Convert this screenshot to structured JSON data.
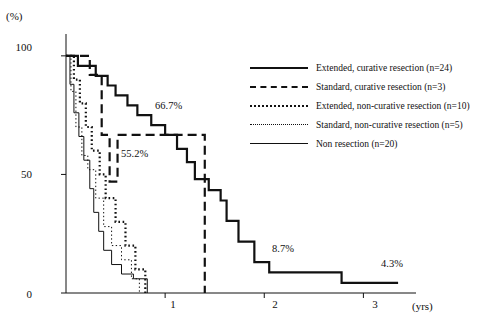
{
  "chart_data": {
    "type": "line",
    "title": "",
    "xlabel": "(yrs)",
    "ylabel": "(%)",
    "xlim": [
      0,
      3.45
    ],
    "ylim": [
      0,
      105
    ],
    "xticks": [
      "1",
      "2",
      "3"
    ],
    "xtick_values": [
      1,
      2,
      3
    ],
    "yticks": [
      "0",
      "50",
      "100"
    ],
    "ytick_values": [
      0,
      50,
      100
    ],
    "grid": false,
    "legend_position": "right-top",
    "annotations": [
      {
        "text": "66.7%",
        "x": 1.02,
        "y": 72
      },
      {
        "text": "55.2%",
        "x": 0.72,
        "y": 55
      },
      {
        "text": "8.7%",
        "x": 1.95,
        "y": 17
      },
      {
        "text": "4.3%",
        "x": 2.78,
        "y": 12
      }
    ],
    "series": [
      {
        "name": "Extended, curative resection",
        "n": 24,
        "label": "Extended, curative resection   (n=24)",
        "style": "solid-thick",
        "color": "#111111",
        "points": [
          [
            0,
            100
          ],
          [
            0.12,
            100
          ],
          [
            0.12,
            95.8
          ],
          [
            0.3,
            95.8
          ],
          [
            0.3,
            91.6
          ],
          [
            0.42,
            91.6
          ],
          [
            0.42,
            87.5
          ],
          [
            0.5,
            87.5
          ],
          [
            0.5,
            83.3
          ],
          [
            0.62,
            83.3
          ],
          [
            0.62,
            79.1
          ],
          [
            0.72,
            79.1
          ],
          [
            0.72,
            75
          ],
          [
            0.86,
            75
          ],
          [
            0.86,
            70.8
          ],
          [
            1.0,
            70.8
          ],
          [
            1.0,
            66.7
          ],
          [
            1.12,
            66.7
          ],
          [
            1.12,
            60.8
          ],
          [
            1.22,
            60.8
          ],
          [
            1.22,
            55.2
          ],
          [
            1.3,
            55.2
          ],
          [
            1.3,
            48
          ],
          [
            1.44,
            48
          ],
          [
            1.44,
            43.4
          ],
          [
            1.56,
            43.4
          ],
          [
            1.56,
            39
          ],
          [
            1.62,
            39
          ],
          [
            1.62,
            30.4
          ],
          [
            1.74,
            30.4
          ],
          [
            1.74,
            21.7
          ],
          [
            1.9,
            21.7
          ],
          [
            1.9,
            13
          ],
          [
            2.05,
            13
          ],
          [
            2.05,
            8.7
          ],
          [
            2.78,
            8.7
          ],
          [
            2.78,
            4.3
          ],
          [
            3.35,
            4.3
          ]
        ]
      },
      {
        "name": "Standard, curative resection",
        "n": 3,
        "label": "Standard, curative resection   (n=3)",
        "style": "dashed-thick",
        "color": "#111111",
        "points": [
          [
            0,
            100
          ],
          [
            0.24,
            100
          ],
          [
            0.24,
            92
          ],
          [
            0.36,
            92
          ],
          [
            0.36,
            66.7
          ],
          [
            0.44,
            66.7
          ],
          [
            0.44,
            47
          ],
          [
            0.52,
            47
          ],
          [
            0.52,
            66.7
          ],
          [
            0.62,
            66.7
          ],
          [
            0.62,
            66.7
          ],
          [
            1.4,
            66.7
          ],
          [
            1.4,
            0
          ]
        ]
      },
      {
        "name": "Extended, non-curative resection",
        "n": 10,
        "label": "Extended, non-curative resection (n=10)",
        "style": "dotted-thick",
        "color": "#111111",
        "points": [
          [
            0,
            100
          ],
          [
            0.08,
            100
          ],
          [
            0.08,
            90
          ],
          [
            0.14,
            90
          ],
          [
            0.14,
            80
          ],
          [
            0.2,
            80
          ],
          [
            0.2,
            70
          ],
          [
            0.26,
            70
          ],
          [
            0.26,
            60
          ],
          [
            0.34,
            60
          ],
          [
            0.34,
            50
          ],
          [
            0.4,
            50
          ],
          [
            0.4,
            40
          ],
          [
            0.5,
            40
          ],
          [
            0.5,
            30
          ],
          [
            0.6,
            30
          ],
          [
            0.6,
            20
          ],
          [
            0.7,
            20
          ],
          [
            0.7,
            10
          ],
          [
            0.8,
            10
          ],
          [
            0.8,
            0
          ]
        ]
      },
      {
        "name": "Standard, non-curative resection",
        "n": 5,
        "label": "Standard, non-curative resection   (n=5)",
        "style": "dotted-thin",
        "color": "#111111",
        "points": [
          [
            0,
            100
          ],
          [
            0.05,
            100
          ],
          [
            0.05,
            85
          ],
          [
            0.1,
            85
          ],
          [
            0.1,
            70
          ],
          [
            0.16,
            70
          ],
          [
            0.16,
            58
          ],
          [
            0.22,
            58
          ],
          [
            0.22,
            52
          ],
          [
            0.3,
            52
          ],
          [
            0.3,
            40
          ],
          [
            0.38,
            40
          ],
          [
            0.38,
            28
          ],
          [
            0.46,
            28
          ],
          [
            0.46,
            20
          ],
          [
            0.56,
            20
          ],
          [
            0.56,
            14
          ],
          [
            0.66,
            14
          ],
          [
            0.66,
            6
          ],
          [
            0.74,
            6
          ],
          [
            0.74,
            0
          ]
        ]
      },
      {
        "name": "Non resection",
        "n": 20,
        "label": "Non resection   (n=20)",
        "style": "solid-thin",
        "color": "#111111",
        "points": [
          [
            0,
            100
          ],
          [
            0.04,
            100
          ],
          [
            0.04,
            88
          ],
          [
            0.08,
            88
          ],
          [
            0.08,
            76
          ],
          [
            0.13,
            76
          ],
          [
            0.13,
            66
          ],
          [
            0.18,
            66
          ],
          [
            0.18,
            56
          ],
          [
            0.24,
            56
          ],
          [
            0.24,
            44
          ],
          [
            0.28,
            44
          ],
          [
            0.28,
            34
          ],
          [
            0.33,
            34
          ],
          [
            0.33,
            26
          ],
          [
            0.38,
            26
          ],
          [
            0.38,
            18
          ],
          [
            0.46,
            18
          ],
          [
            0.46,
            12
          ],
          [
            0.56,
            12
          ],
          [
            0.56,
            8
          ],
          [
            0.68,
            8
          ],
          [
            0.68,
            6
          ],
          [
            0.82,
            6
          ],
          [
            0.82,
            0
          ]
        ]
      }
    ]
  },
  "axis": {
    "y_unit": "(%)",
    "x_unit": "(yrs)"
  }
}
